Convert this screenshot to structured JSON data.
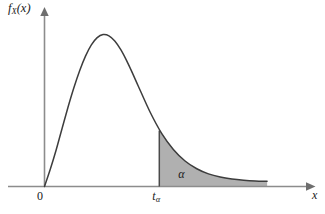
{
  "figure": {
    "kind": "probability-density-curve",
    "background_color": "#ffffff",
    "curve_color": "#3d3d3d",
    "axis_color": "#8c8c8c",
    "shade_color": "#b0b0b0",
    "text_color": "#1a1a1a"
  },
  "labels": {
    "y_axis_main": "f",
    "y_axis_sub": "X",
    "y_axis_arg": "(x)",
    "x_axis": "x",
    "origin": "0",
    "critical_value_main": "t",
    "critical_value_sub": "α",
    "tail_area": "α"
  },
  "chart_data": {
    "type": "line",
    "title": "",
    "xlabel": "x",
    "ylabel": "f_X(x)",
    "grid": false,
    "legend": null,
    "xlim": [
      0,
      10.5
    ],
    "ylim": [
      0,
      1.05
    ],
    "axis_arrows": {
      "x": "right",
      "y": "up"
    },
    "tick_labels": {
      "x": [
        "0",
        "t_α"
      ],
      "y": []
    },
    "series": [
      {
        "name": "density",
        "x": [
          0.0,
          0.25,
          0.5,
          0.75,
          1.0,
          1.25,
          1.5,
          1.75,
          2.0,
          2.25,
          2.5,
          2.75,
          3.0,
          3.25,
          3.5,
          3.75,
          4.0,
          4.5,
          5.0,
          5.5,
          6.0,
          6.5,
          7.0,
          7.5,
          8.0,
          8.5,
          9.0,
          9.5
        ],
        "y": [
          0.0,
          0.115,
          0.242,
          0.382,
          0.52,
          0.648,
          0.762,
          0.858,
          0.932,
          0.98,
          1.0,
          0.992,
          0.958,
          0.902,
          0.83,
          0.748,
          0.662,
          0.492,
          0.35,
          0.244,
          0.168,
          0.117,
          0.083,
          0.062,
          0.049,
          0.041,
          0.036,
          0.034
        ]
      }
    ],
    "annotations": [
      {
        "name": "critical-value-line",
        "type": "vline",
        "x": 4.9,
        "y_top": 0.368,
        "label": "t_α"
      },
      {
        "name": "upper-tail-shaded-area",
        "type": "area-fill",
        "x_from": 4.9,
        "x_to": 9.5,
        "fill": "#b0b0b0",
        "label": "α"
      }
    ]
  }
}
